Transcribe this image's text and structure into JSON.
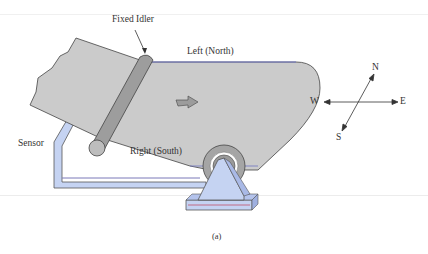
{
  "figure": {
    "caption": "(a)",
    "labels": {
      "fixed_idler": "Fixed Idler",
      "left_north": "Left (North)",
      "right_south": "Right (South)",
      "sensor": "Sensor"
    },
    "compass": {
      "north": "N",
      "south": "S",
      "east": "E",
      "west": "W"
    },
    "colors": {
      "belt": "#c9c9c9",
      "idler": "#9a9a9a",
      "sensor_frame": "#c5d3f2",
      "outline": "#444444",
      "accent_line": "#c0506a"
    }
  }
}
